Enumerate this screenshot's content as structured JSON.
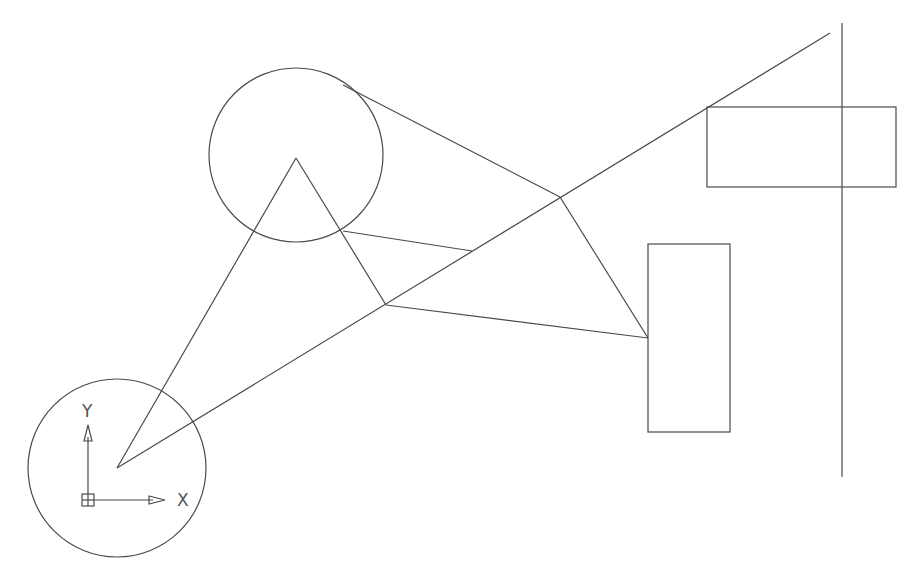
{
  "canvas": {
    "width": 920,
    "height": 581,
    "background": "#ffffff",
    "stroke": "#4a4a4a"
  },
  "circles": [
    {
      "name": "upper-circle",
      "cx": 296,
      "cy": 155,
      "r": 87
    },
    {
      "name": "ucs-circle",
      "cx": 117,
      "cy": 468,
      "r": 89
    }
  ],
  "lines": [
    {
      "name": "long-diagonal-line",
      "x1": 117,
      "y1": 468,
      "x2": 830,
      "y2": 33
    },
    {
      "name": "triangle-left-edge",
      "x1": 117,
      "y1": 468,
      "x2": 296,
      "y2": 158
    },
    {
      "name": "triangle-right-edge",
      "x1": 296,
      "y1": 158,
      "x2": 386,
      "y2": 305
    },
    {
      "name": "tangent-line",
      "x1": 343,
      "y1": 85,
      "x2": 560,
      "y2": 197
    },
    {
      "name": "chord-line",
      "x1": 343,
      "y1": 231,
      "x2": 472,
      "y2": 251
    },
    {
      "name": "lower-edge-line",
      "x1": 386,
      "y1": 305,
      "x2": 648,
      "y2": 338
    },
    {
      "name": "right-edge-line",
      "x1": 560,
      "y1": 197,
      "x2": 648,
      "y2": 338
    },
    {
      "name": "vertical-line",
      "x1": 842,
      "y1": 23,
      "x2": 842,
      "y2": 477
    }
  ],
  "rects": [
    {
      "name": "upper-right-rectangle",
      "x": 707,
      "y": 107,
      "w": 189,
      "h": 80
    },
    {
      "name": "middle-rectangle",
      "x": 648,
      "y": 244,
      "w": 82,
      "h": 188
    }
  ],
  "ucs": {
    "origin": {
      "x": 88,
      "y": 500
    },
    "x_label": "X",
    "y_label": "Y",
    "x_end": 165,
    "y_end": 425
  }
}
